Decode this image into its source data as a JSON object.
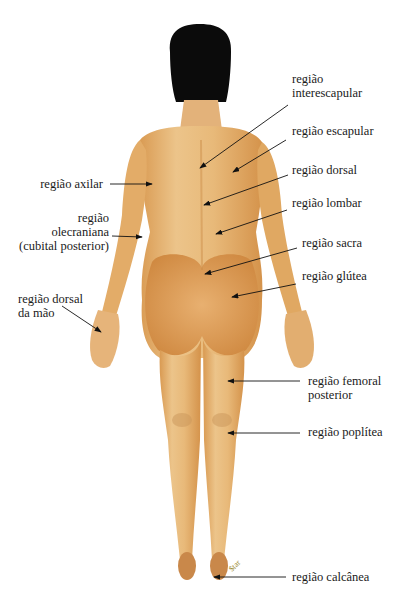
{
  "figure": {
    "type": "anatomical-diagram",
    "view": "posterior",
    "colors": {
      "skin_light": "#ecc48a",
      "skin_mid": "#e2a760",
      "skin_shadow": "#c98a45",
      "hair": "#0b0b0b",
      "line": "#1a1a1a",
      "background": "#ffffff"
    },
    "signature": "Star"
  },
  "labels": {
    "right": [
      {
        "id": "interescapular",
        "text": "região\ninterescapular"
      },
      {
        "id": "escapular",
        "text": "região escapular"
      },
      {
        "id": "dorsal",
        "text": "região dorsal"
      },
      {
        "id": "lombar",
        "text": "região lombar"
      },
      {
        "id": "sacra",
        "text": "região sacra"
      },
      {
        "id": "glutea",
        "text": "região glútea"
      },
      {
        "id": "femoral-posterior",
        "text": "região femoral\nposterior"
      },
      {
        "id": "poplitea",
        "text": "região poplítea"
      },
      {
        "id": "calcanea",
        "text": "região calcânea"
      }
    ],
    "left": [
      {
        "id": "axilar",
        "text": "região axilar"
      },
      {
        "id": "olecraniana",
        "text": "região\nolecraniana\n(cubital posterior)"
      },
      {
        "id": "dorsal-mao",
        "text": "região dorsal\nda mão"
      }
    ]
  }
}
